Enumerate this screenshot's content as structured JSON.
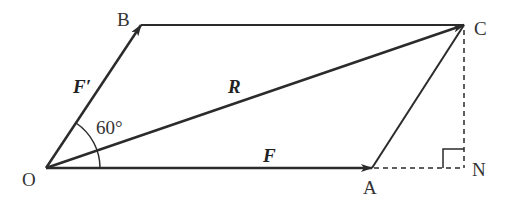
{
  "diagram": {
    "points": {
      "O": {
        "label": "O",
        "x": 46,
        "y": 168
      },
      "A": {
        "label": "A",
        "x": 372,
        "y": 168
      },
      "B": {
        "label": "B",
        "x": 141,
        "y": 25
      },
      "C": {
        "label": "C",
        "x": 464,
        "y": 25
      },
      "N": {
        "label": "N",
        "x": 464,
        "y": 168
      }
    },
    "vectors": {
      "F": {
        "label": "F",
        "from": "O",
        "to": "A"
      },
      "F_prime": {
        "label": "F′",
        "from": "O",
        "to": "B"
      },
      "R": {
        "label": "R",
        "from": "O",
        "to": "C"
      }
    },
    "segments": [
      {
        "from": "B",
        "to": "C",
        "style": "solid"
      },
      {
        "from": "A",
        "to": "C",
        "style": "solid"
      },
      {
        "from": "A",
        "to": "N",
        "style": "dashed"
      },
      {
        "from": "C",
        "to": "N",
        "style": "dashed"
      }
    ],
    "angle": {
      "label": "60°",
      "vertex": "O",
      "between": [
        "F",
        "F′"
      ]
    },
    "right_angle_marker": {
      "at": "N"
    },
    "colors": {
      "line": "#2b2b2b",
      "text": "#333333",
      "background": "#ffffff"
    }
  }
}
